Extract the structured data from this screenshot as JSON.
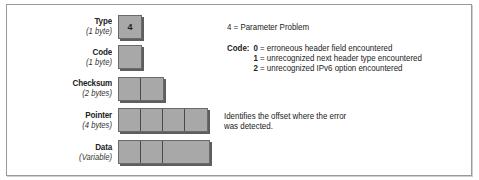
{
  "fields": [
    {
      "name": "Type",
      "size": "(1 byte)",
      "top": 15,
      "cells": [
        {
          "width": 23,
          "value": "4"
        }
      ]
    },
    {
      "name": "Code",
      "size": "(1 byte)",
      "top": 45,
      "cells": [
        {
          "width": 23,
          "value": ""
        }
      ]
    },
    {
      "name": "Checksum",
      "size": "(2 bytes)",
      "top": 77,
      "cells": [
        {
          "width": 22,
          "value": ""
        },
        {
          "width": 22,
          "value": ""
        }
      ]
    },
    {
      "name": "Pointer",
      "size": "(4 bytes)",
      "top": 108,
      "cells": [
        {
          "width": 22,
          "value": ""
        },
        {
          "width": 22,
          "value": ""
        },
        {
          "width": 22,
          "value": ""
        },
        {
          "width": 23,
          "value": ""
        }
      ]
    },
    {
      "name": "Data",
      "size": "(Variable)",
      "top": 140,
      "cells": [
        {
          "width": 22,
          "value": ""
        },
        {
          "width": 22,
          "value": ""
        },
        {
          "width": 47,
          "value": ""
        }
      ]
    }
  ],
  "notes": {
    "type_note": "4 = Parameter Problem",
    "code_header": "Code:",
    "code_values": [
      {
        "num": "0",
        "text": " = erroneous header field encountered"
      },
      {
        "num": "1",
        "text": " = unrecognized next header type encountered"
      },
      {
        "num": "2",
        "text": " = unrecognized IPv6 option encountered"
      }
    ],
    "pointer_note_line1": "Identifies the offset where the error",
    "pointer_note_line2": "was detected."
  },
  "colors": {
    "cell_fill": "#a8a8a8",
    "cell_shadow": "#5e5e5e",
    "frame": "#9a9a9a"
  }
}
